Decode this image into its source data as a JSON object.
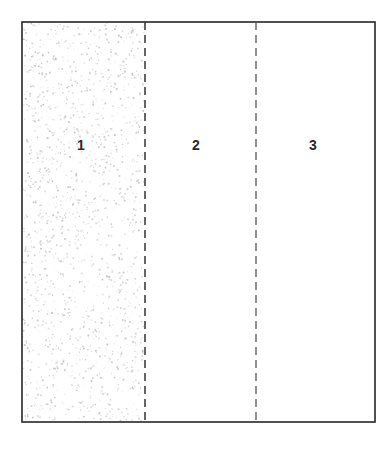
{
  "figure": {
    "type": "schematic-diagram",
    "canvas": {
      "width": 392,
      "height": 454,
      "background": "#ffffff"
    },
    "frame": {
      "name": "outer-rectangle",
      "x": 22,
      "y": 22,
      "width": 353,
      "height": 400,
      "stroke": "#262626",
      "stroke_width": 1.6,
      "fill": "#ffffff"
    },
    "dividers": [
      {
        "name": "divider-1-2",
        "x": 145,
        "y_top": 22,
        "y_bottom": 422,
        "style": "dashed",
        "dash": "8 5",
        "stroke": "#333333",
        "stroke_width": 1.5
      },
      {
        "name": "divider-2-3",
        "x": 256,
        "y_top": 22,
        "y_bottom": 422,
        "style": "dashed",
        "dash": "8 5",
        "stroke": "#555555",
        "stroke_width": 1.3
      }
    ],
    "zones": [
      {
        "id": "zone-1",
        "label": "1",
        "label_x": 81,
        "label_y": 145,
        "x": 22,
        "width": 123,
        "fill": "stipple",
        "fill_color": "#b9b9b9",
        "stipple_density": 1500
      },
      {
        "id": "zone-2",
        "label": "2",
        "label_x": 196,
        "label_y": 145,
        "x": 145,
        "width": 111,
        "fill": "none",
        "fill_color": "#ffffff",
        "stipple_density": 0
      },
      {
        "id": "zone-3",
        "label": "3",
        "label_x": 313,
        "label_y": 145,
        "x": 256,
        "width": 119,
        "fill": "none",
        "fill_color": "#ffffff",
        "stipple_density": 0
      }
    ],
    "colors": {
      "ink": "#262626",
      "dash": "#444444",
      "stipple": "#b9b9b9",
      "paper": "#ffffff"
    }
  }
}
